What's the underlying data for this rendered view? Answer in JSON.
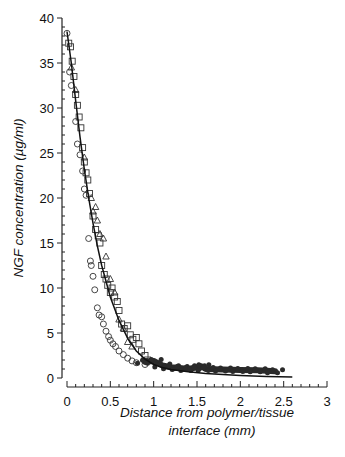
{
  "chart_data": {
    "type": "scatter",
    "title": "",
    "xlabel": "Distance from polymer/tissue interface (mm)",
    "xlabel_lines": [
      "Distance from polymer/tissue",
      "interface (mm)"
    ],
    "ylabel": "NGF concentration (µg/ml)",
    "xlim": [
      0,
      3
    ],
    "ylim": [
      0,
      40
    ],
    "x_ticks": [
      0,
      0.5,
      1,
      1.5,
      2,
      2.5,
      3
    ],
    "x_tick_labels": [
      "0",
      "0.5",
      "1",
      "1.5",
      "2",
      "2.5",
      "3"
    ],
    "y_ticks": [
      0,
      5,
      10,
      15,
      20,
      25,
      30,
      35,
      40
    ],
    "y_tick_labels": [
      "0",
      "5",
      "10",
      "15",
      "20",
      "25",
      "30",
      "35",
      "40"
    ],
    "x_minor_step": 0.1,
    "y_minor_step": 1,
    "grid": false,
    "legend": null,
    "series": [
      {
        "name": "squares",
        "marker": "square",
        "points": [
          [
            0.02,
            37.2
          ],
          [
            0.04,
            36.8
          ],
          [
            0.06,
            35.2
          ],
          [
            0.08,
            33.5
          ],
          [
            0.1,
            31.5
          ],
          [
            0.12,
            30.3
          ],
          [
            0.14,
            29
          ],
          [
            0.16,
            27.8
          ],
          [
            0.18,
            25.6
          ],
          [
            0.2,
            24
          ],
          [
            0.22,
            22.8
          ],
          [
            0.24,
            22
          ],
          [
            0.26,
            20.5
          ],
          [
            0.3,
            18
          ],
          [
            0.33,
            16.5
          ],
          [
            0.36,
            15.8
          ],
          [
            0.38,
            15
          ],
          [
            0.4,
            12.5
          ],
          [
            0.43,
            11.5
          ],
          [
            0.45,
            11
          ],
          [
            0.47,
            10.3
          ],
          [
            0.5,
            9.5
          ],
          [
            0.52,
            10
          ],
          [
            0.55,
            9
          ],
          [
            0.58,
            8.5
          ],
          [
            0.6,
            7.5
          ],
          [
            0.63,
            6
          ],
          [
            0.66,
            5.5
          ],
          [
            0.7,
            5.8
          ],
          [
            0.73,
            4.8
          ],
          [
            0.76,
            4.3
          ],
          [
            0.8,
            4.5
          ],
          [
            0.83,
            3.8
          ],
          [
            0.86,
            3
          ],
          [
            0.9,
            2.5
          ],
          [
            0.93,
            2
          ]
        ]
      },
      {
        "name": "circles",
        "marker": "circle",
        "points": [
          [
            0.0,
            38.3
          ],
          [
            0.03,
            34
          ],
          [
            0.05,
            32.5
          ],
          [
            0.1,
            28.5
          ],
          [
            0.12,
            26
          ],
          [
            0.15,
            24.8
          ],
          [
            0.18,
            23
          ],
          [
            0.2,
            21
          ],
          [
            0.22,
            20.3
          ],
          [
            0.25,
            15.5
          ],
          [
            0.27,
            13
          ],
          [
            0.28,
            12.5
          ],
          [
            0.3,
            11.3
          ],
          [
            0.32,
            9.8
          ],
          [
            0.35,
            7.8
          ],
          [
            0.37,
            7
          ],
          [
            0.4,
            6.8
          ],
          [
            0.42,
            6
          ],
          [
            0.45,
            5.2
          ],
          [
            0.48,
            4.6
          ],
          [
            0.5,
            4.2
          ],
          [
            0.53,
            3.8
          ],
          [
            0.56,
            3.5
          ],
          [
            0.6,
            3
          ],
          [
            0.65,
            2.6
          ],
          [
            0.7,
            2.2
          ],
          [
            0.75,
            1.9
          ],
          [
            0.8,
            1.7
          ],
          [
            0.9,
            1.5
          ]
        ]
      },
      {
        "name": "triangles",
        "marker": "triangle",
        "points": [
          [
            0.05,
            34.5
          ],
          [
            0.1,
            32
          ],
          [
            0.2,
            24.5
          ],
          [
            0.28,
            20
          ],
          [
            0.3,
            18.5
          ],
          [
            0.33,
            19
          ],
          [
            0.35,
            17.5
          ],
          [
            0.38,
            16
          ],
          [
            0.42,
            15.5
          ],
          [
            0.45,
            13.5
          ],
          [
            0.5,
            11
          ],
          [
            0.55,
            9.5
          ],
          [
            0.6,
            6.5
          ],
          [
            0.65,
            5.5
          ],
          [
            0.7,
            4
          ],
          [
            0.75,
            3.5
          ]
        ]
      },
      {
        "name": "dense-band",
        "marker": "band",
        "description": "dense overlapping markers from ~0.9 to ~2.4 mm",
        "points": [
          [
            0.9,
            1.8
          ],
          [
            1.0,
            1.9
          ],
          [
            1.1,
            1.4
          ],
          [
            1.2,
            1.2
          ],
          [
            1.3,
            1.1
          ],
          [
            1.4,
            1.0
          ],
          [
            1.5,
            1.2
          ],
          [
            1.55,
            1.3
          ],
          [
            1.6,
            1.0
          ],
          [
            1.8,
            0.95
          ],
          [
            2.0,
            0.9
          ],
          [
            2.2,
            0.85
          ],
          [
            2.4,
            0.75
          ]
        ]
      },
      {
        "name": "fit",
        "marker": "line",
        "points": [
          [
            0,
            38.5
          ],
          [
            0.05,
            35
          ],
          [
            0.1,
            30.8
          ],
          [
            0.15,
            26.8
          ],
          [
            0.2,
            23.2
          ],
          [
            0.25,
            20
          ],
          [
            0.3,
            17.2
          ],
          [
            0.35,
            14.7
          ],
          [
            0.4,
            12.5
          ],
          [
            0.5,
            9
          ],
          [
            0.6,
            6.4
          ],
          [
            0.7,
            4.4
          ],
          [
            0.8,
            3
          ],
          [
            0.9,
            2.1
          ],
          [
            1.0,
            1.5
          ],
          [
            1.1,
            1.15
          ],
          [
            1.2,
            0.95
          ],
          [
            1.4,
            0.7
          ],
          [
            1.6,
            0.5
          ],
          [
            1.8,
            0.38
          ],
          [
            2.0,
            0.28
          ],
          [
            2.3,
            0.18
          ],
          [
            2.6,
            0.12
          ]
        ]
      }
    ]
  }
}
